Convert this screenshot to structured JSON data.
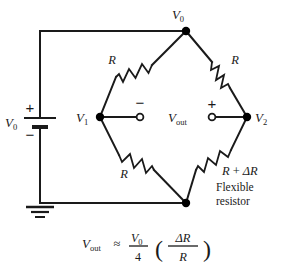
{
  "figure": {
    "type": "circuit-diagram",
    "name": "Wheatstone bridge with flexible resistor",
    "colors": {
      "wire": "#1a1a1a",
      "node": "#000000",
      "background": "#ffffff",
      "terminal_fill": "#ffffff"
    }
  },
  "nodes": {
    "top": "V0",
    "top_sub": "0",
    "left": "V1",
    "left_sub": "1",
    "right": "V2",
    "right_sub": "2",
    "bottom": ""
  },
  "labels": {
    "v_symbol": "V",
    "node_top_sub": "0",
    "node_left_sub": "1",
    "node_right_sub": "2",
    "source_symbol": "V",
    "source_sub": "0",
    "plus": "+",
    "minus": "−",
    "vout_symbol": "V",
    "vout_sub": "out",
    "resistor_tl": "R",
    "resistor_tr": "R",
    "resistor_bl": "R",
    "resistor_br_r": "R",
    "resistor_br_op": "+",
    "resistor_br_delta": "ΔR",
    "flexible_line1": "Flexible",
    "flexible_line2": "resistor"
  },
  "formula": {
    "lhs_symbol": "V",
    "lhs_sub": "out",
    "approx": "≈",
    "num_symbol": "V",
    "num_sub": "0",
    "denominator": "4",
    "paren_open": "(",
    "paren_close": ")",
    "inner_num": "ΔR",
    "inner_den": "R",
    "plain_text": "Vout ≈ (V0/4)(ΔR/R)"
  },
  "components": {
    "battery": "dc-voltage-source",
    "ground": "earth-ground",
    "terminal_left": "output-terminal-negative",
    "terminal_right": "output-terminal-positive"
  }
}
